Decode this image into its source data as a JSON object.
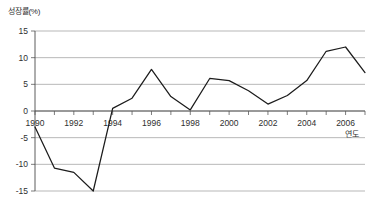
{
  "chart_data": {
    "type": "line",
    "title": "",
    "ylabel": "성장률(%)",
    "xlabel": "연도",
    "grid": true,
    "legend": "none",
    "xlim": [
      1990,
      2007
    ],
    "ylim": [
      -15,
      15
    ],
    "y_ticks": [
      15,
      10,
      5,
      0,
      -5,
      -10,
      -15
    ],
    "y_tick_labels": [
      "15",
      "10",
      "5",
      "0",
      "-5",
      "-10",
      "-15"
    ],
    "x_ticks": [
      1990,
      1991,
      1992,
      1993,
      1994,
      1995,
      1996,
      1997,
      1998,
      1999,
      2000,
      2001,
      2002,
      2003,
      2004,
      2005,
      2006,
      2007
    ],
    "x_tick_labels_shown": [
      "1990",
      "1992",
      "1994",
      "1996",
      "1998",
      "2000",
      "2002",
      "2004",
      "2006"
    ],
    "x": [
      1990,
      1991,
      1992,
      1993,
      1994,
      1995,
      1996,
      1997,
      1998,
      1999,
      2000,
      2001,
      2002,
      2003,
      2004,
      2005,
      2006,
      2007
    ],
    "values": [
      -3.0,
      -10.7,
      -11.5,
      -15.0,
      0.5,
      2.4,
      7.8,
      2.7,
      0.2,
      6.1,
      5.7,
      3.8,
      1.3,
      2.9,
      5.7,
      11.2,
      12.0,
      7.2
    ],
    "series": [
      {
        "name": "성장률",
        "color": "#1c1c1c",
        "values": [
          -3.0,
          -10.7,
          -11.5,
          -15.0,
          0.5,
          2.4,
          7.8,
          2.7,
          0.2,
          6.1,
          5.7,
          3.8,
          1.3,
          2.9,
          5.7,
          11.2,
          12.0,
          7.2
        ]
      }
    ]
  },
  "colors": {
    "line": "#1c1c1c",
    "grid": "#9a9a9a",
    "axis": "#4a4a4a",
    "text": "#2f2f2f",
    "background": "#ffffff"
  }
}
